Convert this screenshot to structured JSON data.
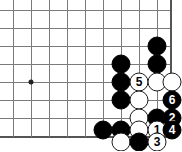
{
  "board": {
    "title": "go-board-diagram",
    "width": 182,
    "height": 151,
    "line_color": "#7a7a7a",
    "edge_color": "#555555",
    "background_color": "#ffffff",
    "black_color": "#000000",
    "white_color": "#ffffff",
    "grid": {
      "columns_x": [
        13,
        31,
        49,
        67,
        85,
        103,
        121,
        139,
        157,
        170
      ],
      "rows_y": [
        10,
        28,
        46,
        64,
        82,
        100,
        118,
        136
      ],
      "bottom_edge_y": 136,
      "right_edge_x": 170
    },
    "star_points": [
      {
        "name": "hoshi",
        "x": 31,
        "y": 82
      }
    ],
    "stones": [
      {
        "name": "black-stone",
        "color": "black",
        "x": 157,
        "y": 46,
        "label": ""
      },
      {
        "name": "black-stone",
        "color": "black",
        "x": 157,
        "y": 64,
        "label": ""
      },
      {
        "name": "black-stone",
        "color": "black",
        "x": 121,
        "y": 64,
        "label": ""
      },
      {
        "name": "black-stone",
        "color": "black",
        "x": 121,
        "y": 82,
        "label": ""
      },
      {
        "name": "white-move-5",
        "color": "white",
        "x": 139,
        "y": 82,
        "label": "5"
      },
      {
        "name": "white-stone",
        "color": "white",
        "x": 157,
        "y": 82,
        "label": ""
      },
      {
        "name": "white-stone",
        "color": "white",
        "x": 172,
        "y": 82,
        "label": ""
      },
      {
        "name": "black-stone",
        "color": "black",
        "x": 121,
        "y": 100,
        "label": ""
      },
      {
        "name": "white-stone",
        "color": "white",
        "x": 139,
        "y": 100,
        "label": ""
      },
      {
        "name": "black-move-6",
        "color": "black",
        "x": 172,
        "y": 100,
        "label": "6"
      },
      {
        "name": "white-stone",
        "color": "white",
        "x": 139,
        "y": 118,
        "label": ""
      },
      {
        "name": "black-stone",
        "color": "black",
        "x": 157,
        "y": 118,
        "label": ""
      },
      {
        "name": "black-move-2",
        "color": "black",
        "x": 172,
        "y": 118,
        "label": "2"
      },
      {
        "name": "black-stone",
        "color": "black",
        "x": 103,
        "y": 130,
        "label": ""
      },
      {
        "name": "black-stone",
        "color": "black",
        "x": 121,
        "y": 130,
        "label": ""
      },
      {
        "name": "white-stone",
        "color": "white",
        "x": 139,
        "y": 130,
        "label": ""
      },
      {
        "name": "white-move-1",
        "color": "white",
        "x": 157,
        "y": 130,
        "label": "1"
      },
      {
        "name": "black-move-4",
        "color": "black",
        "x": 172,
        "y": 130,
        "label": "4"
      },
      {
        "name": "white-stone",
        "color": "white",
        "x": 121,
        "y": 142,
        "label": ""
      },
      {
        "name": "black-stone",
        "color": "black",
        "x": 139,
        "y": 142,
        "label": ""
      },
      {
        "name": "white-move-3",
        "color": "white",
        "x": 157,
        "y": 142,
        "label": "3"
      }
    ],
    "move_sequence": [
      {
        "number": "1",
        "color": "white"
      },
      {
        "number": "2",
        "color": "black"
      },
      {
        "number": "3",
        "color": "white"
      },
      {
        "number": "4",
        "color": "black"
      },
      {
        "number": "5",
        "color": "white"
      },
      {
        "number": "6",
        "color": "black"
      }
    ]
  }
}
